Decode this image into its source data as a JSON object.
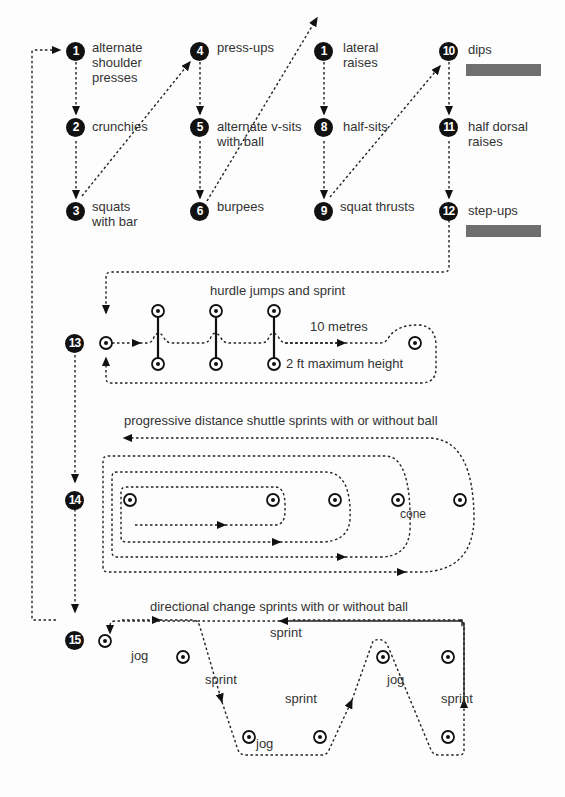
{
  "circuit": [
    {
      "num": "1",
      "label": "alternate\nshoulder\npresses"
    },
    {
      "num": "2",
      "label": "crunchies"
    },
    {
      "num": "3",
      "label": "squats\nwith bar"
    },
    {
      "num": "4",
      "label": "press-ups"
    },
    {
      "num": "5",
      "label": "alternate v-sits\nwith ball"
    },
    {
      "num": "6",
      "label": "burpees"
    },
    {
      "num": "1",
      "label": "lateral\nraises"
    },
    {
      "num": "8",
      "label": "half-sits"
    },
    {
      "num": "9",
      "label": "squat thrusts"
    },
    {
      "num": "10",
      "label": "dips"
    },
    {
      "num": "11",
      "label": "half dorsal\nraises"
    },
    {
      "num": "12",
      "label": "step-ups"
    }
  ],
  "station13": {
    "num": "13",
    "title": "hurdle jumps and sprint",
    "distance": "10 metres",
    "height": "2 ft maximum height"
  },
  "station14": {
    "num": "14",
    "title": "progressive distance shuttle sprints with or without ball",
    "cone_label": "cone"
  },
  "station15": {
    "num": "15",
    "title": "directional change sprints with or without ball",
    "labels": {
      "jog1": "jog",
      "sprint1": "sprint",
      "jog2": "jog",
      "sprint2": "sprint",
      "jog3": "jog",
      "sprint3": "sprint",
      "sprint_top": "sprint"
    }
  },
  "colors": {
    "node": "#111111",
    "bar": "#6f6f6f",
    "line": "#222222"
  }
}
